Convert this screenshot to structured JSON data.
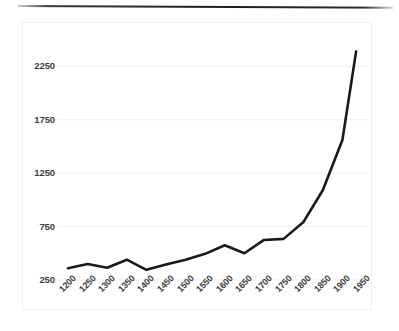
{
  "chart_data": {
    "type": "line",
    "title": "",
    "subtitle": "",
    "xlabel": "",
    "ylabel": "",
    "grid": true,
    "legend": false,
    "legend_position": "none",
    "line_color": "#1a1a1a",
    "background_color": "#ffffff",
    "gridline_color": "#efefef",
    "axis_label_color": "#3d3d3d",
    "xlim": [
      1200,
      1950
    ],
    "ylim": [
      250,
      2450
    ],
    "yticks": [
      250,
      750,
      1250,
      1750,
      2250
    ],
    "ytick_labels": [
      "250",
      "750",
      "1250",
      "1750",
      "2250"
    ],
    "xticks": [
      1200,
      1250,
      1300,
      1350,
      1400,
      1450,
      1500,
      1550,
      1600,
      1650,
      1700,
      1750,
      1800,
      1850,
      1900,
      1950
    ],
    "xtick_labels": [
      "1200",
      "1250",
      "1300",
      "1350",
      "1400",
      "1450",
      "1500",
      "1550",
      "1600",
      "1650",
      "1700",
      "1750",
      "1800",
      "1850",
      "1900",
      "1950"
    ],
    "x": [
      1200,
      1250,
      1300,
      1350,
      1400,
      1450,
      1500,
      1550,
      1600,
      1650,
      1700,
      1750,
      1800,
      1850,
      1900,
      1935
    ],
    "values": [
      360,
      400,
      365,
      440,
      345,
      395,
      440,
      495,
      575,
      500,
      625,
      635,
      790,
      1090,
      1560,
      2390
    ],
    "series": [
      {
        "name": "world population",
        "values": [
          360,
          400,
          365,
          440,
          345,
          395,
          440,
          495,
          575,
          500,
          625,
          635,
          790,
          1090,
          1560,
          2390
        ]
      }
    ]
  },
  "canvas": {
    "plot_left": 68,
    "plot_right": 362,
    "plot_top": 45,
    "plot_bottom": 280
  }
}
